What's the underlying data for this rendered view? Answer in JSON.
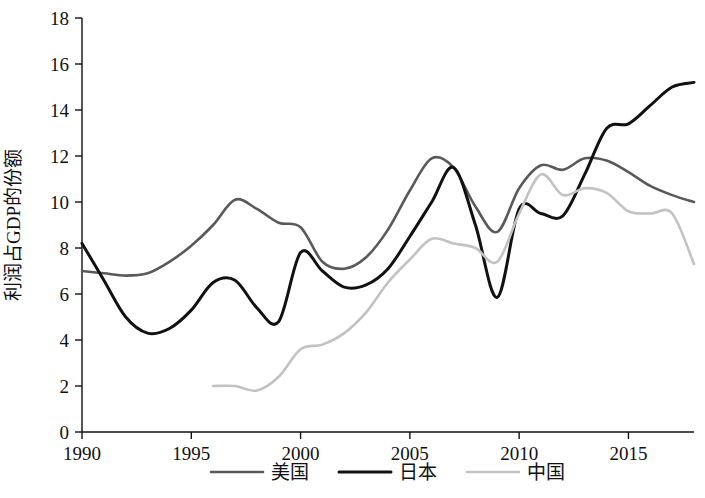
{
  "chart_data": {
    "type": "line",
    "title": "",
    "xlabel": "",
    "ylabel": "利润占GDP的份额",
    "xlim": [
      1990,
      2018
    ],
    "ylim": [
      0,
      18
    ],
    "ytick_step": 2,
    "grid": false,
    "legend_position": "bottom",
    "xticks": [
      "1990",
      "1995",
      "2000",
      "2005",
      "2010",
      "2015"
    ],
    "xtick_values": [
      1990,
      1995,
      2000,
      2005,
      2010,
      2015
    ],
    "yticks": [
      "0",
      "2",
      "4",
      "6",
      "8",
      "10",
      "12",
      "14",
      "16",
      "18"
    ],
    "ytick_values": [
      0,
      2,
      4,
      6,
      8,
      10,
      12,
      14,
      16,
      18
    ],
    "series": [
      {
        "name": "美国",
        "color": "#595959",
        "width": 2.6,
        "x": [
          1990,
          1991,
          1992,
          1993,
          1994,
          1995,
          1996,
          1997,
          1998,
          1999,
          2000,
          2001,
          2002,
          2003,
          2004,
          2005,
          2006,
          2007,
          2008,
          2009,
          2010,
          2011,
          2012,
          2013,
          2014,
          2015,
          2016,
          2017,
          2018
        ],
        "values": [
          7.0,
          6.9,
          6.8,
          6.9,
          7.4,
          8.1,
          9.0,
          10.1,
          9.7,
          9.1,
          8.9,
          7.4,
          7.1,
          7.6,
          8.8,
          10.5,
          11.9,
          11.5,
          9.8,
          8.7,
          10.6,
          11.6,
          11.4,
          11.9,
          11.8,
          11.3,
          10.7,
          10.3,
          10.0
        ]
      },
      {
        "name": "日本",
        "color": "#111111",
        "width": 3.0,
        "x": [
          1990,
          1991,
          1992,
          1993,
          1994,
          1995,
          1996,
          1997,
          1998,
          1999,
          2000,
          2001,
          2002,
          2003,
          2004,
          2005,
          2006,
          2007,
          2008,
          2009,
          2010,
          2011,
          2012,
          2013,
          2014,
          2015,
          2016,
          2017,
          2018
        ],
        "values": [
          8.2,
          6.6,
          5.0,
          4.3,
          4.5,
          5.3,
          6.5,
          6.6,
          5.4,
          4.8,
          7.8,
          7.0,
          6.3,
          6.4,
          7.1,
          8.5,
          10.0,
          11.5,
          9.0,
          5.85,
          9.7,
          9.5,
          9.4,
          11.2,
          13.2,
          13.4,
          14.2,
          15.0,
          15.2
        ]
      },
      {
        "name": "中国",
        "color": "#c2c2c2",
        "width": 2.6,
        "x": [
          1996,
          1997,
          1998,
          1999,
          2000,
          2001,
          2002,
          2003,
          2004,
          2005,
          2006,
          2007,
          2008,
          2009,
          2010,
          2011,
          2012,
          2013,
          2014,
          2015,
          2016,
          2017,
          2018
        ],
        "values": [
          2.0,
          2.0,
          1.8,
          2.4,
          3.6,
          3.8,
          4.3,
          5.2,
          6.5,
          7.5,
          8.4,
          8.2,
          8.0,
          7.4,
          9.5,
          11.2,
          10.3,
          10.6,
          10.4,
          9.6,
          9.5,
          9.5,
          7.3
        ]
      }
    ]
  },
  "legend": {
    "items": [
      {
        "label": "美国",
        "color": "#595959"
      },
      {
        "label": "日本",
        "color": "#111111"
      },
      {
        "label": "中国",
        "color": "#c2c2c2"
      }
    ]
  },
  "axes": {
    "y_title": "利润占GDP的份额"
  }
}
